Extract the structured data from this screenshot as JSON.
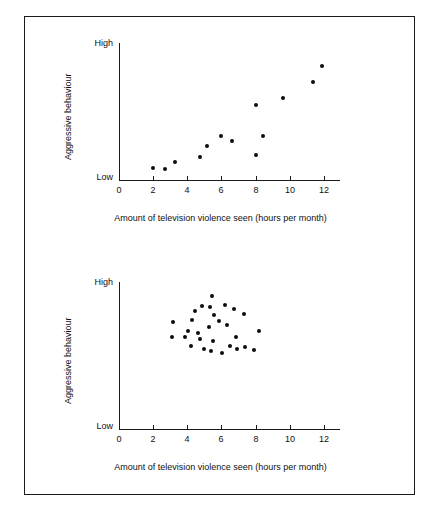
{
  "figure": {
    "background_color": "#ffffff",
    "frame_color": "#1a1a1a",
    "point_color": "#0d0d0d"
  },
  "charts": [
    {
      "id": "top",
      "name": "positive-correlation-scatter",
      "title": "",
      "xlabel": "Amount of television violence seen (hours per month)",
      "ylabel": "Aggressive behaviour",
      "y_high_label": "High",
      "y_low_label": "Low",
      "xticks": [
        "0",
        "2",
        "4",
        "6",
        "8",
        "10",
        "12"
      ],
      "xlim": [
        0,
        12.6
      ],
      "ylim": [
        0,
        1
      ]
    },
    {
      "id": "bottom",
      "name": "no-correlation-scatter",
      "title": "",
      "xlabel": "Amount of television violence seen (hours per month)",
      "ylabel": "Aggressive behaviour",
      "y_high_label": "High",
      "y_low_label": "Low",
      "xticks": [
        "0",
        "2",
        "4",
        "6",
        "8",
        "10",
        "12"
      ],
      "xlim": [
        0,
        12.6
      ],
      "ylim": [
        0,
        1
      ]
    }
  ],
  "chart_data": [
    {
      "type": "scatter",
      "id": "top",
      "title": "Positive correlation between television violence and aggressive behaviour",
      "xlabel": "Amount of television violence seen (hours per month)",
      "ylabel": "Aggressive behaviour",
      "xlim": [
        0,
        12.6
      ],
      "ylim": [
        0,
        1
      ],
      "xticks": [
        0,
        2,
        4,
        6,
        8,
        10,
        12
      ],
      "ytick_labels": [
        "Low",
        "High"
      ],
      "grid": false,
      "legend": null,
      "x": [
        2.0,
        2.7,
        3.3,
        4.75,
        5.15,
        6.0,
        6.6,
        8.0,
        8.05,
        8.45,
        9.6,
        11.35,
        11.9
      ],
      "y": [
        0.085,
        0.08,
        0.135,
        0.165,
        0.245,
        0.325,
        0.285,
        0.185,
        0.545,
        0.325,
        0.6,
        0.715,
        0.835
      ]
    },
    {
      "type": "scatter",
      "id": "bottom",
      "title": "No correlation between television violence and aggressive behaviour",
      "xlabel": "Amount of television violence seen (hours per month)",
      "ylabel": "Aggressive behaviour",
      "xlim": [
        0,
        12.6
      ],
      "ylim": [
        0,
        1
      ],
      "xticks": [
        0,
        2,
        4,
        6,
        8,
        10,
        12
      ],
      "ytick_labels": [
        "Low",
        "High"
      ],
      "grid": false,
      "legend": null,
      "x": [
        5.45,
        4.85,
        5.35,
        6.2,
        6.75,
        4.45,
        5.55,
        7.35,
        4.3,
        5.85,
        3.15,
        5.3,
        6.35,
        4.05,
        4.65,
        8.2,
        3.1,
        3.85,
        4.75,
        5.5,
        6.85,
        4.2,
        6.5,
        7.4,
        5.0,
        5.4,
        6.05,
        6.9,
        7.9
      ],
      "y": [
        0.905,
        0.84,
        0.83,
        0.845,
        0.815,
        0.8,
        0.775,
        0.785,
        0.745,
        0.735,
        0.725,
        0.695,
        0.705,
        0.665,
        0.655,
        0.665,
        0.625,
        0.625,
        0.615,
        0.6,
        0.625,
        0.565,
        0.565,
        0.56,
        0.545,
        0.53,
        0.515,
        0.545,
        0.535
      ]
    }
  ]
}
